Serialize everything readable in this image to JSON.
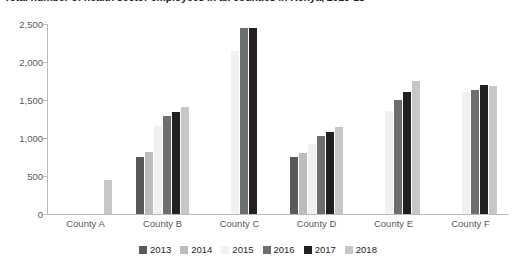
{
  "chart_data": {
    "type": "bar",
    "title": "Total number of health sector employees in all counties in Kenya, 2013-18",
    "xlabel": "",
    "ylabel": "",
    "ylim": [
      0,
      2500
    ],
    "ytick_labels": [
      "2,500",
      "2,000",
      "1,500",
      "1,000",
      "500",
      "0"
    ],
    "ytick_values": [
      2500,
      2000,
      1500,
      1000,
      500,
      0
    ],
    "grid": false,
    "legend_position": "bottom",
    "categories": [
      "County A",
      "County B",
      "County C",
      "County D",
      "County E",
      "County F"
    ],
    "series": [
      {
        "name": "2013",
        "color": "#58595b",
        "values": [
          null,
          755,
          null,
          745,
          null,
          null
        ]
      },
      {
        "name": "2014",
        "color": "#bcbcbc",
        "values": [
          null,
          810,
          null,
          800,
          null,
          null
        ]
      },
      {
        "name": "2015",
        "color": "#f1f1f1",
        "values": [
          null,
          1155,
          2150,
          925,
          1355,
          1610
        ]
      },
      {
        "name": "2016",
        "color": "#6d6e71",
        "values": [
          null,
          1290,
          2450,
          1030,
          1500,
          1630
        ]
      },
      {
        "name": "2017",
        "color": "#231f20",
        "values": [
          null,
          1345,
          2450,
          1085,
          1610,
          1700
        ]
      },
      {
        "name": "2018",
        "color": "#c7c7c7",
        "values": [
          450,
          1405,
          null,
          1150,
          1745,
          1680
        ]
      }
    ]
  },
  "legend": {
    "items": [
      {
        "label": "2013",
        "color": "#58595b"
      },
      {
        "label": "2014",
        "color": "#bcbcbc"
      },
      {
        "label": "2015",
        "color": "#f1f1f1"
      },
      {
        "label": "2016",
        "color": "#6d6e71"
      },
      {
        "label": "2017",
        "color": "#231f20"
      },
      {
        "label": "2018",
        "color": "#c7c7c7"
      }
    ]
  },
  "axis": {
    "line_color": "#bcbcbc",
    "label_color": "#58595b"
  }
}
